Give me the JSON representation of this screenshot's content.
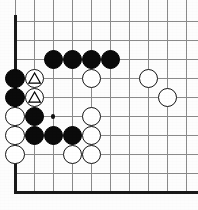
{
  "figure": {
    "kind": "go-board-diagram",
    "board": {
      "columns": 10,
      "rows": 10,
      "origin_x": 15,
      "origin_y": 21,
      "spacing_x": 19.1,
      "spacing_y": 19.1,
      "edge_left": true,
      "edge_top": false,
      "edge_right": false,
      "edge_bottom": true,
      "line_color": "#8a8a8a",
      "edge_color": "#1a1a1a",
      "background_color": "#fdfdfd",
      "line_width": 1,
      "edge_width": 3
    },
    "stone_radius": 9.6,
    "colors": {
      "black_stone": "#0b0b0b",
      "white_stone": "#ffffff",
      "white_stone_border": "#141414",
      "marker": "#000000",
      "star_point": "#111111"
    },
    "star_points": [
      {
        "col": 2,
        "row": 5,
        "radius": 2.1
      }
    ],
    "stones": [
      {
        "color": "black",
        "col": 2,
        "row": 2,
        "marker": "none"
      },
      {
        "color": "black",
        "col": 3,
        "row": 2,
        "marker": "none"
      },
      {
        "color": "black",
        "col": 4,
        "row": 2,
        "marker": "none"
      },
      {
        "color": "black",
        "col": 5,
        "row": 2,
        "marker": "none"
      },
      {
        "color": "black",
        "col": 0,
        "row": 3,
        "marker": "none"
      },
      {
        "color": "white",
        "col": 1,
        "row": 3,
        "marker": "triangle"
      },
      {
        "color": "white",
        "col": 4,
        "row": 3,
        "marker": "none"
      },
      {
        "color": "white",
        "col": 7,
        "row": 3,
        "marker": "none"
      },
      {
        "color": "black",
        "col": 0,
        "row": 4,
        "marker": "none"
      },
      {
        "color": "white",
        "col": 1,
        "row": 4,
        "marker": "triangle"
      },
      {
        "color": "white",
        "col": 8,
        "row": 4,
        "marker": "none"
      },
      {
        "color": "white",
        "col": 0,
        "row": 5,
        "marker": "none"
      },
      {
        "color": "black",
        "col": 1,
        "row": 5,
        "marker": "none"
      },
      {
        "color": "white",
        "col": 4,
        "row": 5,
        "marker": "none"
      },
      {
        "color": "white",
        "col": 0,
        "row": 6,
        "marker": "none"
      },
      {
        "color": "black",
        "col": 1,
        "row": 6,
        "marker": "none"
      },
      {
        "color": "black",
        "col": 2,
        "row": 6,
        "marker": "none"
      },
      {
        "color": "black",
        "col": 3,
        "row": 6,
        "marker": "none"
      },
      {
        "color": "white",
        "col": 4,
        "row": 6,
        "marker": "none"
      },
      {
        "color": "white",
        "col": 0,
        "row": 7,
        "marker": "none"
      },
      {
        "color": "white",
        "col": 3,
        "row": 7,
        "marker": "none"
      },
      {
        "color": "white",
        "col": 4,
        "row": 7,
        "marker": "none"
      }
    ]
  }
}
